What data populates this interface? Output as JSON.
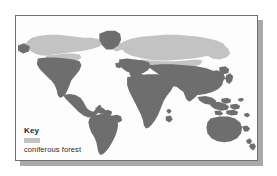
{
  "figure": {
    "name": "world-map-coniferous-forest",
    "type": "thematic-world-map",
    "alt_summary": "Greyscale world map showing the global distribution of coniferous forest (taiga)"
  },
  "colors": {
    "land_other": "#6e6e6e",
    "coniferous_forest": "#c3c3c3",
    "ocean": "#fdfdfd",
    "frame_border": "#6f6f6f",
    "drop_shadow": "#a9a9a9",
    "text": "#2a2a2a",
    "page_background": "#ffffff"
  },
  "legend": {
    "title": "Key",
    "entries": [
      {
        "swatch_color": "#c3c3c3",
        "label": "coniferous forest"
      }
    ]
  },
  "map_data": {
    "projection": "rectangular",
    "regions_with_coniferous_forest": [
      "Alaska",
      "Canada",
      "Scandinavia",
      "Northern Russia",
      "Siberia"
    ],
    "regions_other_land": [
      "United States",
      "Mexico",
      "Central America",
      "South America",
      "Greenland",
      "Europe",
      "Africa",
      "Middle East",
      "India",
      "China",
      "Southeast Asia",
      "Indonesia",
      "Australia",
      "New Zealand",
      "Japan"
    ]
  }
}
